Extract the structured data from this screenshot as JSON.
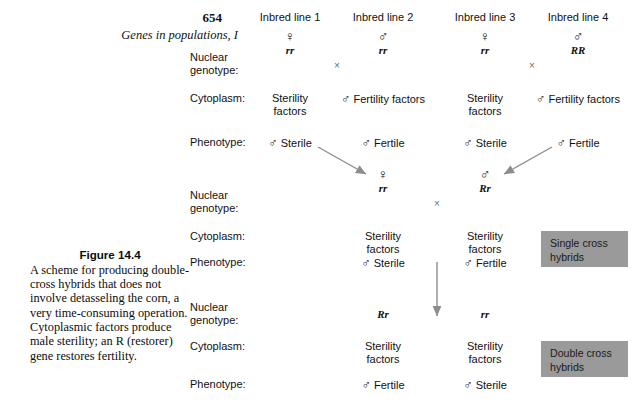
{
  "folio": {
    "number": "654",
    "running_title": "Genes in populations, I"
  },
  "caption": {
    "label": "Figure 14.4",
    "text": "A scheme for producing double-cross hybrids that does not involve detasseling the corn, a very time-consuming operation. Cytoplasmic factors produce male sterility; an R (restorer) gene restores fertility."
  },
  "symbols": {
    "female": "♀",
    "male": "♂",
    "cross": "×"
  },
  "row_labels": {
    "nuclear_genotype": "Nuclear\ngenotype:",
    "cytoplasm": "Cytoplasm:",
    "phenotype": "Phenotype:"
  },
  "generation_parents": {
    "columns": [
      {
        "heading": "Inbred line 1",
        "sex": "♀",
        "genotype": "rr",
        "cytoplasm": "Sterility\nfactors",
        "cytoplasm_sex": "",
        "phenotype": "Sterile",
        "phenotype_sex": "♂"
      },
      {
        "heading": "Inbred line 2",
        "sex": "♂",
        "genotype": "rr",
        "cytoplasm": "Fertility\nfactors",
        "cytoplasm_sex": "♂",
        "phenotype": "Fertile",
        "phenotype_sex": "♂"
      },
      {
        "heading": "Inbred line 3",
        "sex": "♀",
        "genotype": "rr",
        "cytoplasm": "Sterility\nfactors",
        "cytoplasm_sex": "",
        "phenotype": "Sterile",
        "phenotype_sex": "♂"
      },
      {
        "heading": "Inbred line 4",
        "sex": "♂",
        "genotype": "RR",
        "cytoplasm": "Fertility\nfactors",
        "cytoplasm_sex": "♂",
        "phenotype": "Fertile",
        "phenotype_sex": "♂"
      }
    ],
    "cross_left": "×",
    "cross_right": "×"
  },
  "generation_single": {
    "tag": "Single cross\nhybrids",
    "cross": "×",
    "columns": [
      {
        "sex": "♀",
        "genotype": "rr",
        "cytoplasm": "Sterility\nfactors",
        "phenotype": "Sterile",
        "phenotype_sex": "♂"
      },
      {
        "sex": "♂",
        "genotype": "Rr",
        "cytoplasm": "Sterility\nfactors",
        "phenotype": "Fertile",
        "phenotype_sex": "♂"
      }
    ]
  },
  "generation_double": {
    "tag": "Double cross\nhybrids",
    "columns": [
      {
        "genotype": "Rr",
        "cytoplasm": "Sterility\nfactors",
        "phenotype": "Fertile",
        "phenotype_sex": "♂"
      },
      {
        "genotype": "rr",
        "cytoplasm": "Sterility\nfactors",
        "phenotype": "Sterile",
        "phenotype_sex": "♂"
      }
    ]
  },
  "colors": {
    "tag_background": "#9a9a9a",
    "arrow": "#8d8d8d",
    "text": "#111111"
  }
}
